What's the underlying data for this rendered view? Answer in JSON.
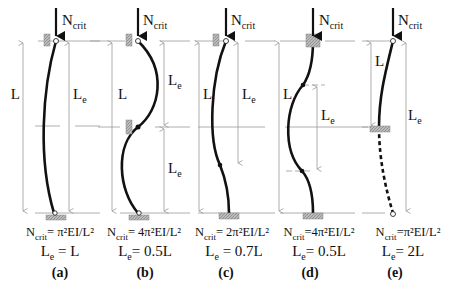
{
  "diagram": {
    "load_label": "N",
    "load_subscript": "crit",
    "length_label": "L",
    "effective_length_label": "L",
    "effective_length_subscript": "e",
    "colors": {
      "line": "#111111",
      "guide": "#999999",
      "support": "#999999"
    },
    "cases": [
      {
        "id": "a",
        "label": "(a)",
        "ncrit_prefix": "N",
        "ncrit_sub": "crit",
        "ncrit_formula": "= π²EI/L²",
        "le_text": "= L",
        "support_top": "pinned-roller",
        "support_bottom": "pinned"
      },
      {
        "id": "b",
        "label": "(b)",
        "ncrit_prefix": "N",
        "ncrit_sub": "crit",
        "ncrit_formula": "= 4π²EI/L²",
        "le_text": "= 0.5L",
        "support_top": "pinned-roller",
        "support_mid": "roller",
        "support_bottom": "pinned"
      },
      {
        "id": "c",
        "label": "(c)",
        "ncrit_prefix": "N",
        "ncrit_sub": "crit",
        "ncrit_formula": "= 2π²EI/L²",
        "le_text": "= 0.7L",
        "support_top": "pinned-roller",
        "support_bottom": "fixed"
      },
      {
        "id": "d",
        "label": "(d)",
        "ncrit_prefix": "N",
        "ncrit_sub": "crit",
        "ncrit_formula": "=4π²EI/L²",
        "le_text": "= 0.5L",
        "support_top": "fixed-sliding",
        "support_bottom": "fixed"
      },
      {
        "id": "e",
        "label": "(e)",
        "ncrit_prefix": "N",
        "ncrit_sub": "crit",
        "ncrit_formula": "=π²EI/L²",
        "le_text": "= 2L",
        "support_top": "free",
        "support_bottom": "fixed"
      }
    ]
  }
}
